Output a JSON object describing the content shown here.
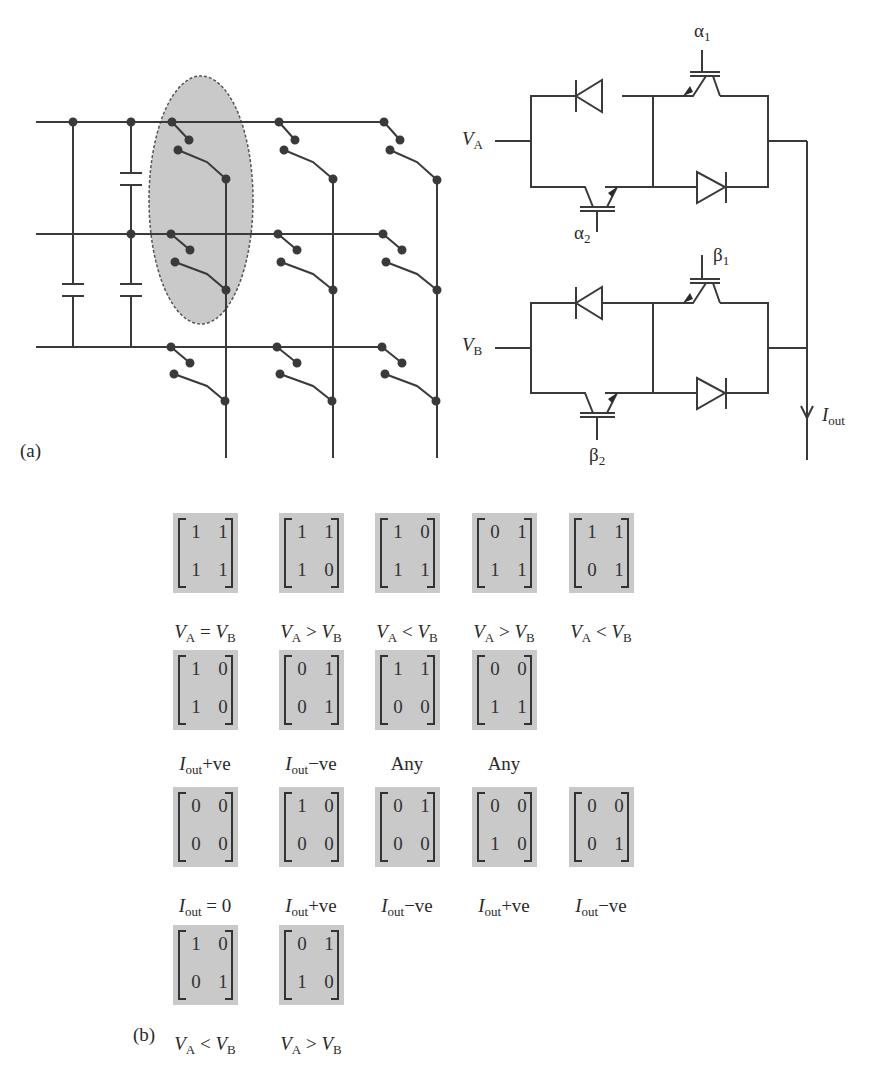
{
  "figure": {
    "panel_a_label": "(a)",
    "panel_b_label": "(b)",
    "circuit_right": {
      "input_a": "V",
      "input_a_sub": "A",
      "input_b": "V",
      "input_b_sub": "B",
      "gate_alpha1": "α",
      "gate_alpha1_sub": "1",
      "gate_alpha2": "α",
      "gate_alpha2_sub": "2",
      "gate_beta1": "β",
      "gate_beta1_sub": "1",
      "gate_beta2": "β",
      "gate_beta2_sub": "2",
      "output": "I",
      "output_sub": "out"
    },
    "colors": {
      "line": "#3a3a3a",
      "highlight": "#c9c9c9",
      "matrix_bg": "#c9c9c9"
    }
  },
  "matrices": [
    {
      "m": [
        "1",
        "1",
        "1",
        "1"
      ],
      "cap": {
        "a": "V",
        "as": "A",
        "op": " = ",
        "b": "V",
        "bs": "B"
      }
    },
    {
      "m": [
        "1",
        "1",
        "1",
        "0"
      ],
      "cap": {
        "a": "V",
        "as": "A",
        "op": " > ",
        "b": "V",
        "bs": "B"
      }
    },
    {
      "m": [
        "1",
        "0",
        "1",
        "1"
      ],
      "cap": {
        "a": "V",
        "as": "A",
        "op": " < ",
        "b": "V",
        "bs": "B"
      }
    },
    {
      "m": [
        "0",
        "1",
        "1",
        "1"
      ],
      "cap": {
        "a": "V",
        "as": "A",
        "op": " > ",
        "b": "V",
        "bs": "B"
      }
    },
    {
      "m": [
        "1",
        "1",
        "0",
        "1"
      ],
      "cap": {
        "a": "V",
        "as": "A",
        "op": " < ",
        "b": "V",
        "bs": "B"
      }
    },
    {
      "m": [
        "1",
        "0",
        "1",
        "0"
      ],
      "cap": {
        "a": "I",
        "as": "out",
        "op": "+ve",
        "b": "",
        "bs": ""
      }
    },
    {
      "m": [
        "0",
        "1",
        "0",
        "1"
      ],
      "cap": {
        "a": "I",
        "as": "out",
        "op": "−ve",
        "b": "",
        "bs": ""
      }
    },
    {
      "m": [
        "1",
        "1",
        "0",
        "0"
      ],
      "cap": {
        "a": "",
        "as": "",
        "op": "Any",
        "b": "",
        "bs": ""
      }
    },
    {
      "m": [
        "0",
        "0",
        "1",
        "1"
      ],
      "cap": {
        "a": "",
        "as": "",
        "op": "Any",
        "b": "",
        "bs": ""
      }
    },
    {
      "m": [
        "0",
        "0",
        "0",
        "0"
      ],
      "cap": {
        "a": "I",
        "as": "out",
        "op": " = 0",
        "b": "",
        "bs": ""
      }
    },
    {
      "m": [
        "1",
        "0",
        "0",
        "0"
      ],
      "cap": {
        "a": "I",
        "as": "out",
        "op": "+ve",
        "b": "",
        "bs": ""
      }
    },
    {
      "m": [
        "0",
        "1",
        "0",
        "0"
      ],
      "cap": {
        "a": "I",
        "as": "out",
        "op": "−ve",
        "b": "",
        "bs": ""
      }
    },
    {
      "m": [
        "0",
        "0",
        "1",
        "0"
      ],
      "cap": {
        "a": "I",
        "as": "out",
        "op": "+ve",
        "b": "",
        "bs": ""
      }
    },
    {
      "m": [
        "0",
        "0",
        "0",
        "1"
      ],
      "cap": {
        "a": "I",
        "as": "out",
        "op": "−ve",
        "b": "",
        "bs": ""
      }
    },
    {
      "m": [
        "1",
        "0",
        "0",
        "1"
      ],
      "cap": {
        "a": "V",
        "as": "A",
        "op": " < ",
        "b": "V",
        "bs": "B"
      }
    },
    {
      "m": [
        "0",
        "1",
        "1",
        "0"
      ],
      "cap": {
        "a": "V",
        "as": "A",
        "op": " > ",
        "b": "V",
        "bs": "B"
      }
    }
  ]
}
